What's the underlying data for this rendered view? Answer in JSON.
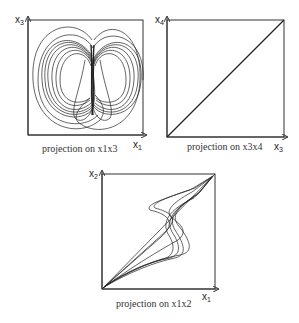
{
  "figure": {
    "panels": [
      {
        "id": "x1x3",
        "caption": "projection on x1x3",
        "x_axis": {
          "base": "x",
          "sub": "1"
        },
        "y_axis": {
          "base": "x",
          "sub": "3"
        },
        "content": "double-scroll attractor trajectories"
      },
      {
        "id": "x3x4",
        "caption": "projection on x3x4",
        "x_axis": {
          "base": "x",
          "sub": "3"
        },
        "y_axis": {
          "base": "x",
          "sub": "4"
        },
        "content": "diagonal line (synchronized)"
      },
      {
        "id": "x1x2",
        "caption": "projection on x1x2",
        "x_axis": {
          "base": "x",
          "sub": "1"
        },
        "y_axis": {
          "base": "x",
          "sub": "2"
        },
        "content": "Z-shaped trajectories along diagonal"
      }
    ]
  }
}
